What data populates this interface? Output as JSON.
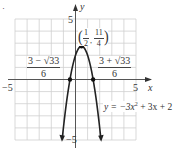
{
  "chart_data": {
    "type": "line",
    "title": "",
    "function": "y = -3x^2 + 3x + 2",
    "xlabel": "x",
    "ylabel": "y",
    "xlim": [
      -5,
      5
    ],
    "ylim": [
      -5,
      5
    ],
    "grid": true,
    "grid_step": 1,
    "tick_labels": {
      "x_min": "−5",
      "x_max": "5",
      "y_max": "5",
      "y_min": "−5"
    },
    "series": [
      {
        "name": "y = −3x² + 3x + 2",
        "x": [
          -1.1,
          -0.8,
          -0.5,
          -0.3,
          -0.1,
          0,
          0.2,
          0.4,
          0.5,
          0.6,
          0.8,
          1.0,
          1.2,
          1.4,
          1.6,
          1.8,
          2.1
        ],
        "values": [
          -4.93,
          -2.32,
          -0.25,
          0.83,
          1.67,
          2,
          2.48,
          2.72,
          2.75,
          2.72,
          2.48,
          2,
          1.28,
          0.32,
          -0.88,
          -2.32,
          -4.93
        ]
      }
    ],
    "points": [
      {
        "label": "vertex",
        "x": 0.5,
        "y": 2.75
      },
      {
        "label": "left x-intercept",
        "x": -0.457,
        "y": 0
      },
      {
        "label": "right x-intercept",
        "x": 1.457,
        "y": 0
      }
    ],
    "annotations": {
      "vertex": {
        "open": "(",
        "num1": "1",
        "den1": "2",
        "comma": ",",
        "num2": "11",
        "den2": "4",
        "close": ")"
      },
      "left_root": {
        "numerator": "3 − √33",
        "denominator": "6"
      },
      "right_root": {
        "numerator": "3 + √33",
        "denominator": "6"
      },
      "equation": {
        "lhs": "y = −3x",
        "exp": "2",
        "rhs": " + 3x + 2"
      }
    }
  },
  "page": {
    "marker": "·"
  }
}
